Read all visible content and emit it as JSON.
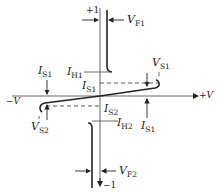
{
  "diagram": {
    "type": "I-V characteristic (bilateral switch / DIAC-like)",
    "axes": {
      "x_pos": "+V",
      "x_neg": "−V",
      "y_pos": "+1",
      "y_neg": "−1"
    },
    "labels": {
      "VF1_main": "V",
      "VF1_sub": "F1",
      "IH1_main": "I",
      "IH1_sub": "H1",
      "IS1_top_main": "I",
      "IS1_top_sub": "S1",
      "IS1_left_main": "I",
      "IS1_left_sub": "S1",
      "VS1_main": "V",
      "VS1_sub": "S1",
      "IS2_main": "I",
      "IS2_sub": "S2",
      "IS1_right_main": "I",
      "IS1_right_sub": "S1",
      "VS2_main": "V",
      "VS2_sub": "S2",
      "IH2_main": "I",
      "IH2_sub": "H2",
      "VF2_main": "V",
      "VF2_sub": "F2"
    },
    "colors": {
      "line": "#222222",
      "axis": "#555555",
      "background": "#ffffff"
    }
  }
}
